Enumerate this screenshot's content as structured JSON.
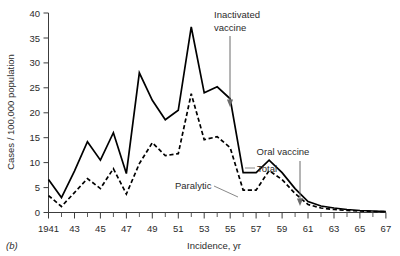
{
  "figure": {
    "panel_label": "(b)",
    "background_color": "#ffffff",
    "ink_color": "#000000",
    "annotation_color": "#6b6b6b"
  },
  "chart_data": {
    "type": "line",
    "title": "",
    "xlabel": "Incidence, yr",
    "ylabel": "Cases / 100,000 population",
    "xlim": [
      1941,
      1967
    ],
    "ylim": [
      0,
      40
    ],
    "grid": false,
    "legend_position": "inline-annotations",
    "x": [
      1941,
      1942,
      1943,
      1944,
      1945,
      1946,
      1947,
      1948,
      1949,
      1950,
      1951,
      1952,
      1953,
      1954,
      1955,
      1956,
      1957,
      1958,
      1959,
      1960,
      1961,
      1962,
      1963,
      1964,
      1965,
      1966,
      1967
    ],
    "x_major_ticks": [
      1941,
      1943,
      1945,
      1947,
      1949,
      1951,
      1953,
      1955,
      1957,
      1959,
      1961,
      1963,
      1965,
      1967
    ],
    "x_tick_labels": [
      "1941",
      "43",
      "45",
      "47",
      "49",
      "51",
      "53",
      "55",
      "57",
      "59",
      "61",
      "63",
      "65",
      "67"
    ],
    "y_major_ticks": [
      0,
      5,
      10,
      15,
      20,
      25,
      30,
      35,
      40
    ],
    "y_tick_labels": [
      "0",
      "5",
      "10",
      "15",
      "20",
      "25",
      "30",
      "35",
      "40"
    ],
    "series": [
      {
        "name": "Total",
        "style": "solid",
        "color": "#000000",
        "values": [
          6.6,
          3.0,
          8.3,
          14.2,
          10.5,
          16.0,
          7.8,
          28.0,
          22.5,
          18.6,
          20.5,
          37.2,
          24.0,
          25.2,
          22.8,
          8.0,
          8.0,
          10.5,
          8.0,
          4.8,
          2.2,
          1.3,
          0.9,
          0.6,
          0.4,
          0.3,
          0.2
        ]
      },
      {
        "name": "Paralytic",
        "style": "dashed",
        "color": "#000000",
        "values": [
          3.4,
          1.2,
          4.0,
          6.8,
          4.8,
          8.8,
          3.7,
          9.8,
          14.0,
          11.4,
          11.8,
          23.8,
          14.6,
          15.2,
          13.0,
          4.5,
          4.5,
          8.4,
          6.6,
          3.8,
          1.6,
          0.9,
          0.6,
          0.4,
          0.3,
          0.2,
          0.15
        ]
      }
    ],
    "annotations": [
      {
        "name": "inactivated-vaccine",
        "text_line1": "Inactivated",
        "text_line2": "vaccine",
        "points_to_year": 1955,
        "arrow": true
      },
      {
        "name": "oral-vaccine",
        "text_line1": "Oral vaccine",
        "text_line2": "",
        "points_to_year": 1961,
        "arrow": true
      },
      {
        "name": "total-label",
        "text_line1": "Total",
        "text_line2": "",
        "leader": true
      },
      {
        "name": "paralytic-label",
        "text_line1": "Paralytic",
        "text_line2": "",
        "leader": true
      }
    ]
  }
}
